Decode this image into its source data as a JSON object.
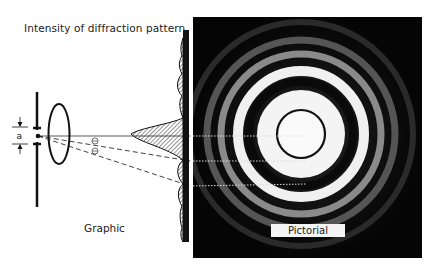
{
  "labels": {
    "intensity_title": "Intensity of diffraction pattern",
    "graphic": "Graphic",
    "pictorial": "Pictorial",
    "aperture": "a",
    "angle_symbol": "θ"
  },
  "diagram": {
    "aperture_label": "a",
    "angle_markers": [
      "θ",
      "θ"
    ],
    "ring_markers_y": [
      136,
      161,
      186
    ],
    "colors": {
      "line": "#111111",
      "photo_background": "#050505",
      "ring_bright": "#f2f2f2",
      "dotted": "#dddddd"
    }
  }
}
